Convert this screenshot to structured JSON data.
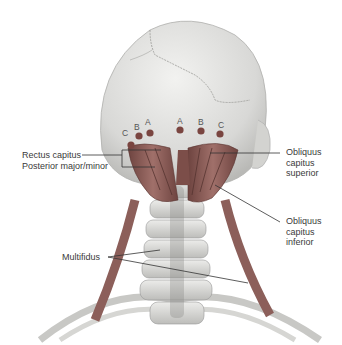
{
  "figure": {
    "colors": {
      "muscle": "#8a5a55",
      "bone": "#d9d9d6",
      "skull": "#e2e2e0",
      "point": "#7a4540",
      "leader": "#333333"
    }
  },
  "points": [
    {
      "id": "C-left",
      "label": "C"
    },
    {
      "id": "B-left",
      "label": "B"
    },
    {
      "id": "A-left",
      "label": "A"
    },
    {
      "id": "A-right",
      "label": "A"
    },
    {
      "id": "B-right",
      "label": "B"
    },
    {
      "id": "C-right",
      "label": "C"
    }
  ],
  "labels": {
    "rectus_line1": "Rectus capitus",
    "rectus_line2": "Posterior major/minor",
    "obl_sup_line1": "Obliquus",
    "obl_sup_line2": "capitus",
    "obl_sup_line3": "superior",
    "obl_inf_line1": "Obliquus",
    "obl_inf_line2": "capitus",
    "obl_inf_line3": "inferior",
    "multifidus": "Multifidus"
  }
}
